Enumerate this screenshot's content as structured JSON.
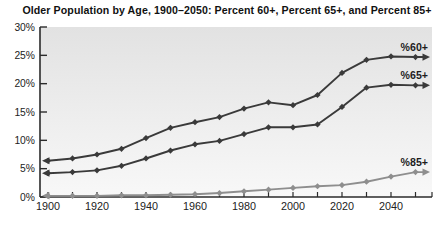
{
  "title": "Older Population by Age, 1900–2050: Percent 60+, Percent 65+, and Percent 85+",
  "chart_data": {
    "type": "line",
    "x": [
      1900,
      1910,
      1920,
      1930,
      1940,
      1950,
      1960,
      1970,
      1980,
      1990,
      2000,
      2010,
      2020,
      2030,
      2040,
      2050
    ],
    "series": [
      {
        "name": "%60+",
        "color": "#3a3a3a",
        "values": [
          6.4,
          6.8,
          7.5,
          8.5,
          10.4,
          12.2,
          13.2,
          14.1,
          15.6,
          16.7,
          16.2,
          18.0,
          21.9,
          24.2,
          24.8,
          24.7
        ]
      },
      {
        "name": "%65+",
        "color": "#3a3a3a",
        "values": [
          4.2,
          4.4,
          4.7,
          5.5,
          6.8,
          8.2,
          9.3,
          9.9,
          11.1,
          12.3,
          12.3,
          12.8,
          15.9,
          19.3,
          19.8,
          19.7
        ]
      },
      {
        "name": "%85+",
        "color": "#8e8e8e",
        "values": [
          0.2,
          0.2,
          0.2,
          0.3,
          0.3,
          0.4,
          0.5,
          0.7,
          1.0,
          1.3,
          1.6,
          1.9,
          2.1,
          2.7,
          3.6,
          4.4
        ]
      }
    ],
    "title": "Older Population by Age, 1900–2050: Percent 60+, Percent 65+, and Percent 85+",
    "xlabel": "",
    "ylabel": "",
    "xlim": [
      1900,
      2050
    ],
    "ylim": [
      0,
      30
    ],
    "grid": false,
    "marker": "diamond",
    "line_end_arrows": true,
    "legend_position": "end-of-line-labels",
    "x_tick_labels": [
      "1900",
      "1920",
      "1940",
      "1960",
      "1980",
      "2000",
      "2020",
      "2040"
    ],
    "y_tick_labels": [
      "0%",
      "5%",
      "10%",
      "15%",
      "20%",
      "25%",
      "30%"
    ],
    "plot_bg_top_color": "#e2e2e2",
    "plot_bg_bottom_color": "#f8f8f8",
    "axis_color": "#2b2b2b",
    "tick_label_color": "#222222"
  }
}
